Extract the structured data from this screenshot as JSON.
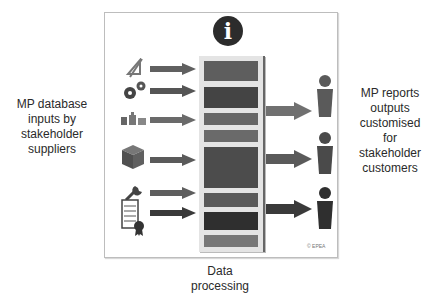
{
  "labels": {
    "left": "MP database inputs by stakeholder suppliers",
    "left_lines": [
      "MP database",
      "inputs by",
      "stakeholder",
      "suppliers"
    ],
    "right_lines": [
      "MP reports",
      "outputs",
      "customised",
      "for",
      "stakeholder",
      "customers"
    ],
    "bottom_lines": [
      "Data",
      "processing"
    ],
    "copyright": "© EPEA",
    "info_glyph": "i"
  },
  "inputs": [
    {
      "icon": "ruler-triangle-icon"
    },
    {
      "icon": "gears-icon"
    },
    {
      "icon": "factory-icon"
    },
    {
      "icon": "box-cube-icon"
    },
    {
      "icon": "wrench-icon"
    },
    {
      "icon": "certificate-icon"
    }
  ],
  "outputs": [
    {
      "icon": "person-icon"
    },
    {
      "icon": "person-icon"
    },
    {
      "icon": "person-icon"
    }
  ],
  "colors": {
    "block_dark": "#3f3f3f",
    "block_mid": "#585858",
    "block_light": "#707070",
    "arrow": "#5f5f5f",
    "person": "#3c3c3c"
  }
}
